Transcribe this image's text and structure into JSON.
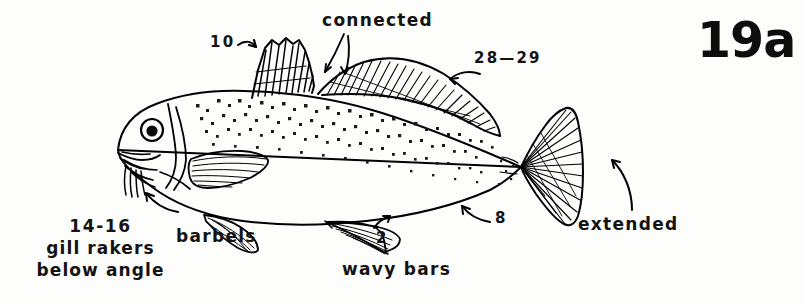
{
  "figure": {
    "number": "19a",
    "style": "black-and-white ink illustration with annotation labels"
  },
  "annotations": {
    "first_dorsal_spines": {
      "text": "10",
      "target": "first-dorsal-fin",
      "arrow": "curved-right-down"
    },
    "connected": {
      "text": "connected",
      "target": "dorsal-fins-junction",
      "arrow": "double-pronged-down"
    },
    "second_dorsal_rays": {
      "text": "28—29",
      "target": "second-dorsal-fin",
      "arrow": "curved-left"
    },
    "caudal": {
      "text": "extended",
      "target": "caudal-fin",
      "arrow": "curved-up-left"
    },
    "anal_rays": {
      "text": "8",
      "target": "anal-fin",
      "arrow": "curved-up-left"
    },
    "anal_spines": {
      "text": "2",
      "target": "anal-fin-spines",
      "arrow": "short-up-right"
    },
    "body_pattern": {
      "text": "wavy bars",
      "target": "body-speckle-bars"
    },
    "barbels": {
      "text": "barbels",
      "target": "chin-barbels"
    },
    "gill_rakers": {
      "lines": [
        "14-16",
        "gill rakers",
        "below angle"
      ],
      "target": "gill-cover",
      "arrow": "up-left"
    }
  },
  "colors": {
    "ink": "#131313",
    "paper": "#fdfdfc",
    "line": "#000000"
  }
}
